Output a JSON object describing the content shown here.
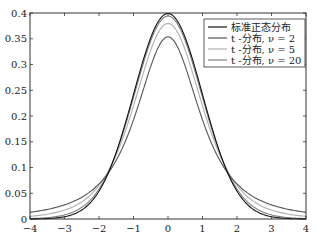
{
  "chart_data": {
    "type": "line",
    "title": "",
    "xlabel": "",
    "ylabel": "",
    "xlim": [
      -4,
      4
    ],
    "ylim": [
      0,
      0.4
    ],
    "grid": false,
    "legend_position": "top-right",
    "x_ticks": [
      -4,
      -3,
      -2,
      -1,
      0,
      1,
      2,
      3,
      4
    ],
    "x_tick_labels": [
      "−4",
      "−3",
      "−2",
      "−1",
      "0",
      "1",
      "2",
      "3",
      "4"
    ],
    "y_ticks": [
      0,
      0.05,
      0.1,
      0.15,
      0.2,
      0.25,
      0.3,
      0.35,
      0.4
    ],
    "y_tick_labels": [
      "0",
      "0.05",
      "0.1",
      "0.15",
      "0.2",
      "0.25",
      "0.3",
      "0.35",
      "0.4"
    ],
    "series": [
      {
        "name": "标准正态分布",
        "kind": "normal",
        "dof": null,
        "color": "#111111",
        "peak": 0.3989
      },
      {
        "name": "t -分布, ν = 2",
        "kind": "t",
        "dof": 2,
        "color": "#555555",
        "peak": 0.3536
      },
      {
        "name": "t -分布, ν = 5",
        "kind": "t",
        "dof": 5,
        "color": "#b0b0b0",
        "peak": 0.3796
      },
      {
        "name": "t -分布, ν = 20",
        "kind": "t",
        "dof": 20,
        "color": "#808080",
        "peak": 0.394
      }
    ]
  }
}
